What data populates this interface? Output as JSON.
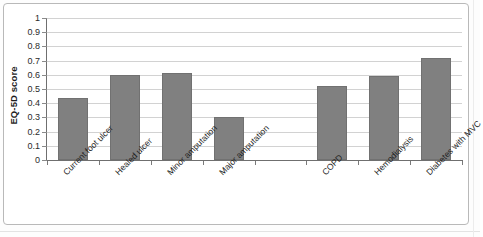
{
  "chart_data": {
    "type": "bar",
    "title": "",
    "xlabel": "",
    "ylabel": "EQ-5D score",
    "ylim": [
      0,
      1
    ],
    "ytick_labels": [
      "1",
      "0.9",
      "0.8",
      "0.7",
      "0.6",
      "0.5",
      "0.4",
      "0.3",
      "0.2",
      "0.1",
      "0"
    ],
    "ytick_values": [
      1,
      0.9,
      0.8,
      0.7,
      0.6,
      0.5,
      0.4,
      0.3,
      0.2,
      0.1,
      0
    ],
    "grid": true,
    "legend": "none",
    "bar_color": "#808080",
    "bar_border_color": "#717171",
    "categories": [
      "Current foot ulcer",
      "Healed ulcer",
      "Minor amputation",
      "Major amputation",
      "",
      "COPD",
      "Hemodialysis",
      "Diabetes with MVC"
    ],
    "values": [
      0.44,
      0.6,
      0.61,
      0.3,
      null,
      0.52,
      0.59,
      0.72
    ],
    "slots": 8,
    "empty_slot_index": 4,
    "annotations": []
  },
  "figure": {
    "y_axis_title": "EQ-5D score"
  }
}
